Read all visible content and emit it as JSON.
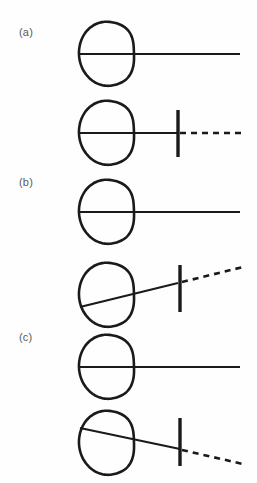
{
  "figure": {
    "background_color": "#fefefe",
    "ink_color": "#1a1a1a",
    "label_color": "#5a5a5a",
    "width": 257,
    "height": 483
  },
  "panels": [
    {
      "id": "a",
      "label": "(a)",
      "label_x": 19,
      "label_y": 26,
      "rows": [
        {
          "id": "a-top",
          "name": "eye-without-lens",
          "eye": {
            "cx": 107,
            "cy": 54,
            "rx": 28,
            "ry": 32
          },
          "axis": {
            "x1": 80,
            "y1": 54,
            "x2": 240,
            "y2": 54,
            "style": "solid"
          },
          "lens": null,
          "dashed": null
        },
        {
          "id": "a-bottom",
          "name": "eye-with-lens",
          "eye": {
            "cx": 107,
            "cy": 133,
            "rx": 28,
            "ry": 32
          },
          "axis": {
            "x1": 80,
            "y1": 133,
            "x2": 178,
            "y2": 133,
            "style": "solid"
          },
          "lens": {
            "x": 178,
            "y1": 110,
            "y2": 157
          },
          "dashed": {
            "x1": 180,
            "y1": 133,
            "x2": 243,
            "y2": 133
          }
        }
      ]
    },
    {
      "id": "b",
      "label": "(b)",
      "label_x": 19,
      "label_y": 176,
      "rows": [
        {
          "id": "b-top",
          "name": "eye-without-lens",
          "eye": {
            "cx": 107,
            "cy": 212,
            "rx": 28,
            "ry": 32
          },
          "axis": {
            "x1": 80,
            "y1": 212,
            "x2": 240,
            "y2": 212,
            "style": "solid"
          },
          "lens": null,
          "dashed": null
        },
        {
          "id": "b-bottom",
          "name": "eye-with-lens-tilted-up",
          "eye": {
            "cx": 107,
            "cy": 295,
            "rx": 28,
            "ry": 32
          },
          "axis": {
            "x1": 80,
            "y1": 307,
            "x2": 178,
            "y2": 283,
            "style": "solid"
          },
          "lens": {
            "x": 180,
            "y1": 265,
            "y2": 312
          },
          "dashed": {
            "x1": 182,
            "y1": 282,
            "x2": 243,
            "y2": 267
          }
        }
      ]
    },
    {
      "id": "c",
      "label": "(c)",
      "label_x": 19,
      "label_y": 331,
      "rows": [
        {
          "id": "c-top",
          "name": "eye-without-lens",
          "eye": {
            "cx": 107,
            "cy": 367,
            "rx": 28,
            "ry": 32
          },
          "axis": {
            "x1": 80,
            "y1": 367,
            "x2": 240,
            "y2": 367,
            "style": "solid"
          },
          "lens": null,
          "dashed": null
        },
        {
          "id": "c-bottom",
          "name": "eye-with-lens-tilted-down",
          "eye": {
            "cx": 107,
            "cy": 443,
            "rx": 28,
            "ry": 32
          },
          "axis": {
            "x1": 80,
            "y1": 428,
            "x2": 180,
            "y2": 449,
            "style": "solid"
          },
          "lens": {
            "x": 180,
            "y1": 418,
            "y2": 466
          },
          "dashed": {
            "x1": 182,
            "y1": 450,
            "x2": 243,
            "y2": 464
          }
        }
      ]
    }
  ],
  "style": {
    "eye_stroke_width": 2.6,
    "axis_stroke_width": 2.2,
    "lens_stroke_width": 3.4,
    "dash_pattern": "6 5"
  }
}
